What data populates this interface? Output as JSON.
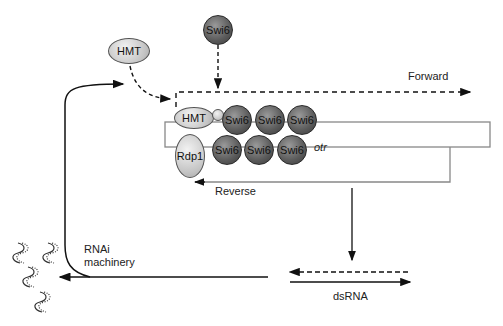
{
  "diagram": {
    "nodes": {
      "hmt_free": "HMT",
      "swi6_free": "Swi6",
      "hmt_bound": "HMT",
      "rdp1": "Rdp1",
      "swi6_top": [
        "Swi6",
        "Swi6",
        "Swi6"
      ],
      "swi6_bottom": [
        "Swi6",
        "Swi6",
        "Swi6"
      ]
    },
    "labels": {
      "forward": "Forward",
      "reverse": "Reverse",
      "otr": "otr",
      "rnai_line1": "RNAi",
      "rnai_line2": "machinery",
      "dsrna": "dsRNA"
    },
    "colors": {
      "line": "#111111",
      "box": "#888888",
      "light_node": "#c4c4c4",
      "dark_node": "#5a5a5a"
    }
  }
}
